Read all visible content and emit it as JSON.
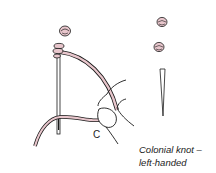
{
  "figure": {
    "title": "Colonial knot – left-handed",
    "label_c": "C",
    "caption": {
      "line1": "Colonial knot  –",
      "line2": "left-handed"
    },
    "colors": {
      "thread": "#e8c6cc",
      "outline": "#1a1a1a",
      "background": "#ffffff"
    }
  }
}
